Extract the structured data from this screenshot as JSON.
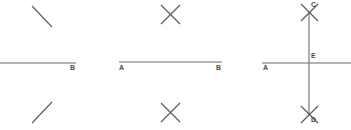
{
  "figure": {
    "kind": "geometry-construction",
    "canvas": {
      "width": 351,
      "height": 130,
      "background": "#ffffff"
    },
    "stroke_color": "#6b6b6b",
    "label_color": "#4a4a4a",
    "panels": [
      {
        "id": "panel-1",
        "step": "1",
        "description": "Line with single arc strokes above and below",
        "baseline": {
          "x1": 0,
          "y1": 63,
          "x2": 76,
          "y2": 63
        },
        "labels": [
          {
            "name": "B",
            "text": "B",
            "x": 70,
            "y": 66
          }
        ],
        "arcs": [
          {
            "name": "arc-above",
            "x1": 32,
            "y1": 6,
            "x2": 52,
            "y2": 26,
            "direction": "down-right"
          },
          {
            "name": "arc-below",
            "x1": 32,
            "y1": 122,
            "x2": 52,
            "y2": 102,
            "direction": "up-right"
          }
        ]
      },
      {
        "id": "panel-2",
        "step": "2",
        "description": "Segment AB with crossing arc pairs above and below",
        "baseline": {
          "x1": 119,
          "y1": 62,
          "x2": 222,
          "y2": 62
        },
        "labels": [
          {
            "name": "A",
            "text": "A",
            "x": 119,
            "y": 66
          },
          {
            "name": "B",
            "text": "B",
            "x": 216,
            "y": 66
          }
        ],
        "crosses": [
          {
            "name": "cross-above",
            "cx": 170,
            "cy": 14,
            "size": 18
          },
          {
            "name": "cross-below",
            "cx": 170,
            "cy": 112,
            "size": 18
          }
        ]
      },
      {
        "id": "panel-3",
        "step": "3",
        "description": "Completed perpendicular bisector through C, E and D",
        "baseline": {
          "x1": 262,
          "y1": 63,
          "x2": 351,
          "y2": 63
        },
        "perpendicular": {
          "x1": 309,
          "y1": 13,
          "x2": 309,
          "y2": 114
        },
        "labels": [
          {
            "name": "A",
            "text": "A",
            "x": 263,
            "y": 66
          },
          {
            "name": "C",
            "text": "C",
            "x": 311,
            "y": 1
          },
          {
            "name": "E",
            "text": "E",
            "x": 311,
            "y": 53
          },
          {
            "name": "D",
            "text": "D",
            "x": 311,
            "y": 115
          }
        ],
        "crosses": [
          {
            "name": "cross-point-c",
            "cx": 309,
            "cy": 12,
            "size": 17
          },
          {
            "name": "cross-point-d",
            "cx": 309,
            "cy": 114,
            "size": 17
          }
        ]
      }
    ]
  }
}
